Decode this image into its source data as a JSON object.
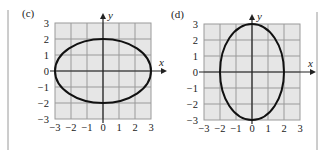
{
  "colors": {
    "grid_fill": "#e6e6e6",
    "grid_line": "#9a9a9a",
    "axis": "#222222",
    "curve": "#111111",
    "separator": "#9a9a9a"
  },
  "chart_data": [
    {
      "type": "line",
      "label": "(c)",
      "title": "",
      "xlabel": "x",
      "ylabel": "y",
      "xlim": [
        -3,
        3
      ],
      "ylim": [
        -3,
        3
      ],
      "grid": true,
      "xticks": [
        "−3",
        "−2",
        "−1",
        "0",
        "1",
        "2",
        "3"
      ],
      "yticks": [
        "3",
        "2",
        "1",
        "0",
        "−1",
        "−2",
        "−3"
      ],
      "curve": {
        "shape": "ellipse",
        "center": [
          0,
          0
        ],
        "semi_axis_x": 3,
        "semi_axis_y": 2,
        "equation": "x^2/9 + y^2/4 = 1",
        "key_points": [
          [
            3,
            0
          ],
          [
            0,
            2
          ],
          [
            -3,
            0
          ],
          [
            0,
            -2
          ]
        ]
      }
    },
    {
      "type": "line",
      "label": "(d)",
      "title": "",
      "xlabel": "x",
      "ylabel": "y",
      "xlim": [
        -3,
        3
      ],
      "ylim": [
        -3,
        3
      ],
      "grid": true,
      "xticks": [
        "−3",
        "−2",
        "−1",
        "0",
        "1",
        "2",
        "3"
      ],
      "yticks": [
        "3",
        "2",
        "1",
        "0",
        "−1",
        "−2",
        "−3"
      ],
      "curve": {
        "shape": "ellipse",
        "center": [
          0,
          0
        ],
        "semi_axis_x": 2,
        "semi_axis_y": 3,
        "equation": "x^2/4 + y^2/9 = 1",
        "key_points": [
          [
            2,
            0
          ],
          [
            0,
            3
          ],
          [
            -2,
            0
          ],
          [
            0,
            -3
          ]
        ]
      }
    }
  ]
}
